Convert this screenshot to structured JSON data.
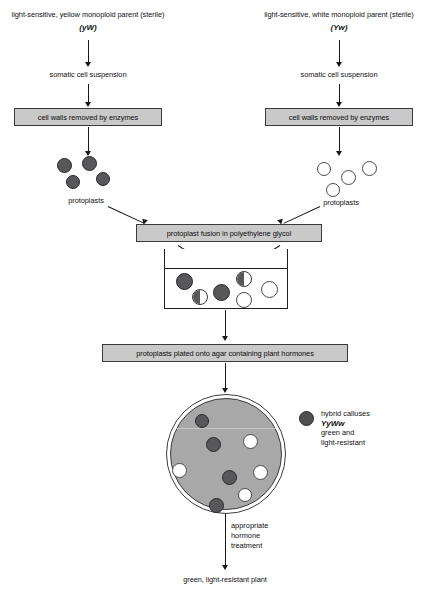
{
  "diagram": {
    "left_branch": {
      "parent_label": "light-sensitive, yellow monoploid parent (sterile)",
      "parent_genotype": "(yW)",
      "step_suspension": "somatic cell suspension",
      "step_cellwalls": "cell walls removed by enzymes",
      "protoplasts_label": "protoplasts"
    },
    "right_branch": {
      "parent_label": "light-sensitive, white monoploid parent (sterile)",
      "parent_genotype": "(Yw)",
      "step_suspension": "somatic cell suspension",
      "step_cellwalls": "cell walls removed by enzymes",
      "protoplasts_label": "protoplasts"
    },
    "fusion_step": "protoplast fusion in polyethylene glycol",
    "plating_step": "protoplasts plated onto agar containing plant hormones",
    "hormone_treatment_line1": "appropriate",
    "hormone_treatment_line2": "hormone",
    "hormone_treatment_line3": "treatment",
    "final_product": "green, light-resistant plant",
    "legend": {
      "line1": "hybrid calluses",
      "genotype": "YyWw",
      "line3": "green and",
      "line4": "light-resistant",
      "marker_color": "#4f4f51"
    },
    "colors": {
      "box_fill": "#c9c9c9",
      "box_border": "#3a3a3a",
      "dark_cell": "#58585a",
      "light_cell": "#ffffff",
      "dish_agar": "#a8a8a8",
      "line": "#181818"
    }
  }
}
